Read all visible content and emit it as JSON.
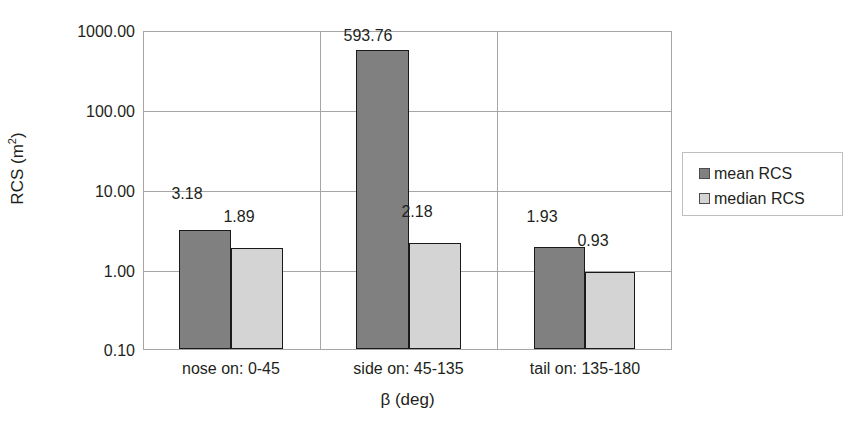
{
  "chart_data": {
    "type": "bar",
    "title": "",
    "subtitle": "",
    "xlabel": "β (deg)",
    "ylabel": "RCS (m²)",
    "ylabel_base": "RCS (m",
    "ylabel_sup": "2",
    "ylabel_close": ")",
    "yscale": "log",
    "ylim": [
      0.1,
      1000
    ],
    "ytick_labels": [
      "1000.00",
      "100.00",
      "10.00",
      "1.00",
      "0.10"
    ],
    "ytick_values": [
      1000,
      100,
      10,
      1,
      0.1
    ],
    "grid": true,
    "legend_position": "right",
    "categories": [
      "nose on:  0-45",
      "side on: 45-135",
      "tail on: 135-180"
    ],
    "series": [
      {
        "name": "mean RCS",
        "color": "#808080",
        "values": [
          3.18,
          593.76,
          1.93
        ],
        "labels": [
          "3.18",
          "593.76",
          "1.93"
        ]
      },
      {
        "name": "median RCS",
        "color": "#d4d4d4",
        "values": [
          1.89,
          2.18,
          0.93
        ],
        "labels": [
          "1.89",
          "2.18",
          "0.93"
        ]
      }
    ]
  },
  "axes": {
    "y_ticks": [
      {
        "label": "1000.00",
        "value": 1000
      },
      {
        "label": "100.00",
        "value": 100
      },
      {
        "label": "10.00",
        "value": 10
      },
      {
        "label": "1.00",
        "value": 1
      },
      {
        "label": "0.10",
        "value": 0.1
      }
    ],
    "x_categories": [
      {
        "label": "nose on:  0-45"
      },
      {
        "label": "side on: 45-135"
      },
      {
        "label": "tail on: 135-180"
      }
    ],
    "y_title_base": "RCS (m",
    "y_title_sup": "2",
    "y_title_close": ")",
    "x_title": "β (deg)"
  },
  "legend": {
    "items": [
      {
        "label": "mean RCS",
        "color": "#808080"
      },
      {
        "label": "median RCS",
        "color": "#d4d4d4"
      }
    ]
  },
  "data_labels": {
    "g1_mean": "3.18",
    "g1_median": "1.89",
    "g2_mean": "593.76",
    "g2_median": "2.18",
    "g3_mean": "1.93",
    "g3_median": "0.93"
  },
  "colors": {
    "mean": "#808080",
    "median": "#d4d4d4",
    "grid": "#a6a6a6",
    "bar_border": "#1a1a1a",
    "text": "#231f20"
  }
}
